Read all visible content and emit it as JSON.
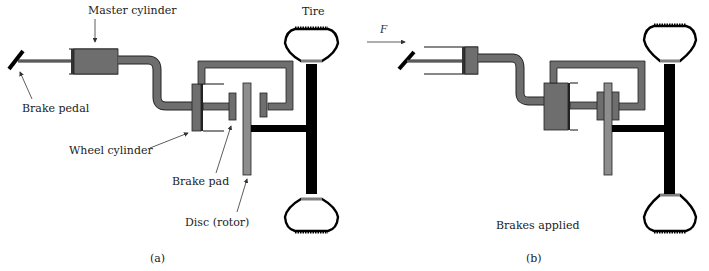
{
  "figure": {
    "panels": [
      {
        "id": "a",
        "caption": "(a)",
        "labels": {
          "master_cylinder": "Master cylinder",
          "brake_pedal": "Brake pedal",
          "wheel_cylinder": "Wheel cylinder",
          "brake_pad": "Brake pad",
          "disc": "Disc (rotor)",
          "tire": "Tire"
        }
      },
      {
        "id": "b",
        "caption": "(b)",
        "labels": {
          "force": "F",
          "state": "Brakes applied"
        }
      }
    ],
    "colors": {
      "fluid": "#6e6e6e",
      "rotor": "#8d8d8d",
      "axle": "#000000",
      "outline": "#222222"
    }
  }
}
